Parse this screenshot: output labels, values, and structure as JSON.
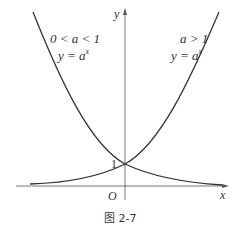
{
  "figure": {
    "caption": "图 2-7",
    "axes": {
      "x_label": "x",
      "y_label": "y",
      "origin_label": "O",
      "y_intercept_label": "1"
    },
    "curves": [
      {
        "name": "decreasing-exponential",
        "condition": "0 < a < 1",
        "equation": "y = a",
        "exponent": "x"
      },
      {
        "name": "increasing-exponential",
        "condition": "a > 1",
        "equation": "y = a",
        "exponent": "x"
      }
    ],
    "colors": {
      "curve": "#333333",
      "axis": "#555555",
      "text": "#333333"
    }
  }
}
